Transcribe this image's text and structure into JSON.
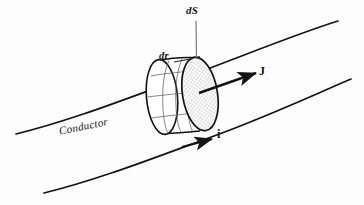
{
  "figure": {
    "kind": "physics-diagram",
    "background_color": "#fdfdfd",
    "ink_color": "#141414",
    "width": 364,
    "height": 205
  },
  "labels": {
    "ds": "dS",
    "dr": "dr",
    "current_density": "J",
    "current": "i",
    "conductor": "Conductor"
  },
  "annotations": {
    "ds_description": "differential surface element, leader line points to top of shaded cross-section",
    "dr_description": "differential length along the conductor axis, leader line points to top edge of cylinder",
    "j_description": "current density vector arrow, points up and to the right",
    "i_description": "current arrow, points right along the conductor",
    "conductor_description": "italic label on the conductor body between the two boundary curves"
  },
  "geometry": {
    "conductor_top_curve": "from (16,134) curving up to (338,21)",
    "conductor_bottom_curve": "from (44,193) curving up to (351,79)",
    "cylinder_left_face_center": [
      162,
      97
    ],
    "cylinder_right_face_center": [
      200,
      94
    ],
    "shaded_face_fill": "stippled gray",
    "mesh_lines": 6
  },
  "colors": {
    "stroke": "#141414",
    "stipple": "#8a8a8a",
    "mesh": "#5a5a5a",
    "background": "#fdfdfd"
  }
}
